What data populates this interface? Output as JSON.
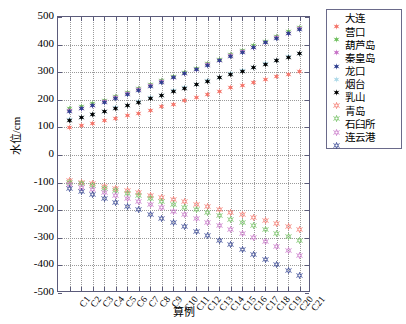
{
  "chart_data": {
    "type": "scatter",
    "title": "",
    "xlabel": "算例",
    "ylabel": "水位/cm",
    "ylim": [
      -500,
      500
    ],
    "yticks": [
      -500,
      -400,
      -300,
      -200,
      -100,
      0,
      100,
      200,
      300,
      400,
      500
    ],
    "grid": true,
    "legend_position": "right",
    "categories": [
      "C1",
      "C2",
      "C3",
      "C4",
      "C5",
      "C6",
      "C7",
      "C8",
      "C9",
      "C10",
      "C11",
      "C12",
      "C13",
      "C14",
      "C15",
      "C16",
      "C17",
      "C18",
      "C19",
      "C20",
      "C21"
    ],
    "series": [
      {
        "name": "大连",
        "color": "#f4766b",
        "marker": "star-filled",
        "filled": true,
        "values": [
          100,
          106,
          113,
          124,
          133,
          142,
          151,
          163,
          174,
          184,
          197,
          209,
          219,
          231,
          243,
          253,
          264,
          274,
          283,
          292,
          302
        ]
      },
      {
        "name": "营口",
        "color": "#6fbf5e",
        "marker": "star-filled",
        "filled": true,
        "values": [
          167,
          176,
          185,
          198,
          213,
          226,
          240,
          255,
          270,
          285,
          300,
          315,
          331,
          347,
          363,
          379,
          395,
          412,
          428,
          446,
          463
        ]
      },
      {
        "name": "葫芦岛",
        "color": "#c773c7",
        "marker": "star-filled",
        "filled": true,
        "values": [
          160,
          170,
          180,
          194,
          208,
          222,
          236,
          251,
          266,
          281,
          296,
          311,
          327,
          343,
          359,
          375,
          391,
          408,
          424,
          441,
          458
        ]
      },
      {
        "name": "秦皇岛",
        "color": "#2f3f8f",
        "marker": "star-filled",
        "filled": true,
        "values": [
          158,
          168,
          178,
          192,
          206,
          220,
          234,
          249,
          264,
          279,
          294,
          309,
          325,
          341,
          357,
          373,
          389,
          406,
          422,
          439,
          456
        ]
      },
      {
        "name": "龙口",
        "color": "#aed9e8",
        "marker": "star-filled",
        "filled": true,
        "values": [
          128,
          137,
          147,
          159,
          171,
          180,
          194,
          207,
          216,
          232,
          244,
          256,
          269,
          281,
          294,
          306,
          318,
          331,
          343,
          356,
          368
        ]
      },
      {
        "name": "烟台",
        "color": "#000000",
        "marker": "star-filled",
        "filled": true,
        "values": [
          126,
          135,
          146,
          157,
          169,
          178,
          192,
          205,
          214,
          230,
          242,
          254,
          267,
          279,
          292,
          304,
          316,
          329,
          341,
          354,
          366
        ]
      },
      {
        "name": "乳山",
        "color": "#f4766b",
        "marker": "star-open",
        "filled": false,
        "values": [
          -94,
          -99,
          -105,
          -113,
          -121,
          -129,
          -136,
          -145,
          -153,
          -161,
          -170,
          -179,
          -188,
          -197,
          -207,
          -217,
          -227,
          -237,
          -248,
          -259,
          -270
        ]
      },
      {
        "name": "青岛",
        "color": "#6fbf5e",
        "marker": "star-open",
        "filled": false,
        "values": [
          -99,
          -105,
          -112,
          -121,
          -130,
          -139,
          -148,
          -158,
          -168,
          -178,
          -189,
          -199,
          -210,
          -221,
          -233,
          -245,
          -257,
          -270,
          -283,
          -297,
          -311
        ]
      },
      {
        "name": "石臼所",
        "color": "#c773c7",
        "marker": "star-open",
        "filled": false,
        "values": [
          -108,
          -116,
          -124,
          -135,
          -146,
          -157,
          -168,
          -180,
          -192,
          -204,
          -217,
          -230,
          -243,
          -257,
          -271,
          -285,
          -300,
          -315,
          -331,
          -347,
          -363
        ]
      },
      {
        "name": "连云港",
        "color": "#2f3f8f",
        "marker": "star-open",
        "filled": false,
        "values": [
          -122,
          -133,
          -144,
          -157,
          -171,
          -185,
          -199,
          -214,
          -229,
          -244,
          -260,
          -276,
          -292,
          -309,
          -326,
          -343,
          -361,
          -379,
          -398,
          -417,
          -437
        ]
      }
    ]
  }
}
